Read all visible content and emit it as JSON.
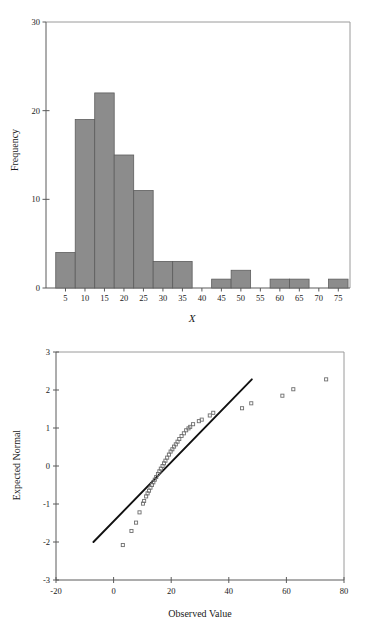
{
  "document": {
    "kind": "statistics-figure-page",
    "background_color": "#ffffff",
    "bar_fill_color": "#8c8c8c",
    "bar_edge_color": "#5d5d5d",
    "marker_color": "#6e6e6e",
    "line_color": "#111111",
    "axis_color": "#5a5a5a"
  },
  "chart_data": [
    {
      "id": "histogram",
      "type": "bar",
      "title": "",
      "xlabel": "X",
      "ylabel": "Frequency",
      "xlim": [
        0,
        78
      ],
      "ylim": [
        0,
        30
      ],
      "xticks": [
        5,
        10,
        15,
        20,
        25,
        30,
        35,
        40,
        45,
        50,
        55,
        60,
        65,
        70,
        75
      ],
      "yticks": [
        0,
        10,
        20,
        30
      ],
      "grid": false,
      "legend": "none",
      "bin_width": 5,
      "categories": [
        "2.5-7.5",
        "7.5-12.5",
        "12.5-17.5",
        "17.5-22.5",
        "22.5-27.5",
        "27.5-32.5",
        "32.5-37.5",
        "37.5-42.5",
        "42.5-47.5",
        "47.5-52.5",
        "52.5-57.5",
        "57.5-62.5",
        "62.5-67.5",
        "67.5-72.5",
        "72.5-77.5"
      ],
      "bin_centers": [
        5,
        10,
        15,
        20,
        25,
        30,
        35,
        40,
        45,
        50,
        55,
        60,
        65,
        70,
        75
      ],
      "values": [
        4,
        19,
        22,
        15,
        11,
        3,
        3,
        0,
        1,
        2,
        0,
        1,
        1,
        0,
        1
      ]
    },
    {
      "id": "qq-plot",
      "type": "scatter",
      "title": "",
      "xlabel": "Observed Value",
      "ylabel": "Expected Normal",
      "xlim": [
        -20,
        80
      ],
      "ylim": [
        -3,
        3
      ],
      "xticks": [
        -20,
        0,
        20,
        40,
        60,
        80
      ],
      "yticks": [
        3,
        2,
        1,
        0,
        -1,
        -2,
        -3
      ],
      "grid": false,
      "legend": "none",
      "reference_line": {
        "x": [
          -7,
          48
        ],
        "y": [
          -2.0,
          2.28
        ]
      },
      "points": [
        {
          "x": 3.2,
          "y": -2.08
        },
        {
          "x": 6.2,
          "y": -1.71
        },
        {
          "x": 7.8,
          "y": -1.49
        },
        {
          "x": 9.0,
          "y": -1.22
        },
        {
          "x": 10.2,
          "y": -0.99
        },
        {
          "x": 10.6,
          "y": -0.92
        },
        {
          "x": 11.3,
          "y": -0.8
        },
        {
          "x": 11.8,
          "y": -0.72
        },
        {
          "x": 12.3,
          "y": -0.65
        },
        {
          "x": 12.8,
          "y": -0.57
        },
        {
          "x": 13.3,
          "y": -0.5
        },
        {
          "x": 13.8,
          "y": -0.43
        },
        {
          "x": 14.3,
          "y": -0.36
        },
        {
          "x": 14.8,
          "y": -0.29
        },
        {
          "x": 15.4,
          "y": -0.21
        },
        {
          "x": 15.9,
          "y": -0.14
        },
        {
          "x": 16.4,
          "y": -0.07
        },
        {
          "x": 17.0,
          "y": 0.0
        },
        {
          "x": 17.5,
          "y": 0.07
        },
        {
          "x": 18.0,
          "y": 0.14
        },
        {
          "x": 18.6,
          "y": 0.22
        },
        {
          "x": 19.2,
          "y": 0.3
        },
        {
          "x": 19.8,
          "y": 0.38
        },
        {
          "x": 20.4,
          "y": 0.44
        },
        {
          "x": 21.0,
          "y": 0.51
        },
        {
          "x": 21.6,
          "y": 0.57
        },
        {
          "x": 22.2,
          "y": 0.64
        },
        {
          "x": 22.8,
          "y": 0.71
        },
        {
          "x": 23.6,
          "y": 0.79
        },
        {
          "x": 24.4,
          "y": 0.86
        },
        {
          "x": 25.2,
          "y": 0.94
        },
        {
          "x": 26.0,
          "y": 0.99
        },
        {
          "x": 26.6,
          "y": 1.03
        },
        {
          "x": 27.6,
          "y": 1.1
        },
        {
          "x": 29.6,
          "y": 1.18
        },
        {
          "x": 30.6,
          "y": 1.22
        },
        {
          "x": 33.4,
          "y": 1.33
        },
        {
          "x": 34.6,
          "y": 1.4
        },
        {
          "x": 44.6,
          "y": 1.52
        },
        {
          "x": 47.8,
          "y": 1.65
        },
        {
          "x": 58.6,
          "y": 1.85
        },
        {
          "x": 62.4,
          "y": 2.02
        },
        {
          "x": 73.8,
          "y": 2.28
        }
      ]
    }
  ]
}
